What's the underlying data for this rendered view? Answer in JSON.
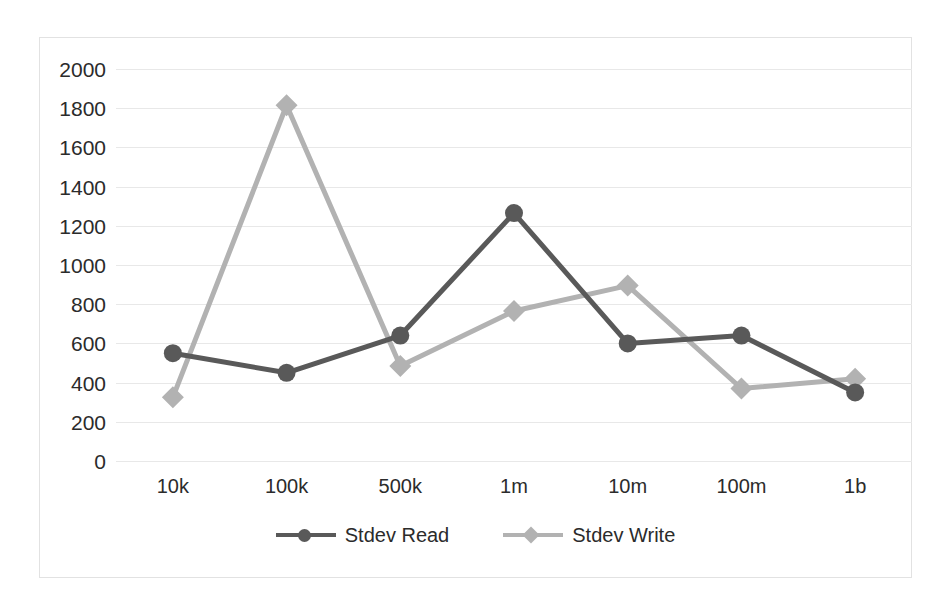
{
  "chart_data": {
    "type": "line",
    "title": "",
    "xlabel": "",
    "ylabel": "",
    "categories": [
      "10k",
      "100k",
      "500k",
      "1m",
      "10m",
      "100m",
      "1b"
    ],
    "ylim": [
      0,
      2000
    ],
    "yticks": [
      2000,
      1800,
      1600,
      1400,
      1200,
      1000,
      800,
      600,
      400,
      200,
      0
    ],
    "ytick_labels": [
      "2000",
      "1800",
      "1600",
      "1400",
      "1200",
      "1000",
      "800",
      "600",
      "400",
      "200",
      "0"
    ],
    "grid": true,
    "legend_position": "bottom",
    "series": [
      {
        "name": "Stdev Read",
        "color": "#595959",
        "marker": "circle",
        "values": [
          550,
          450,
          640,
          1265,
          600,
          640,
          350
        ]
      },
      {
        "name": "Stdev Write",
        "color": "#b2b2b2",
        "marker": "diamond",
        "values": [
          325,
          1815,
          485,
          765,
          895,
          370,
          420
        ]
      }
    ]
  },
  "axes": {
    "y_tick_labels": [
      "2000",
      "1800",
      "1600",
      "1400",
      "1200",
      "1000",
      "800",
      "600",
      "400",
      "200",
      "0"
    ],
    "x_tick_labels": [
      "10k",
      "100k",
      "500k",
      "1m",
      "10m",
      "100m",
      "1b"
    ]
  },
  "legend": {
    "items": [
      {
        "label": "Stdev Read",
        "color": "#595959",
        "marker": "circle"
      },
      {
        "label": "Stdev Write",
        "color": "#b2b2b2",
        "marker": "diamond"
      }
    ]
  },
  "colors": {
    "read": "#595959",
    "write": "#b2b2b2",
    "grid": "#e8e8e8",
    "frame": "#e2e2e2",
    "text": "#2b2b2b"
  }
}
